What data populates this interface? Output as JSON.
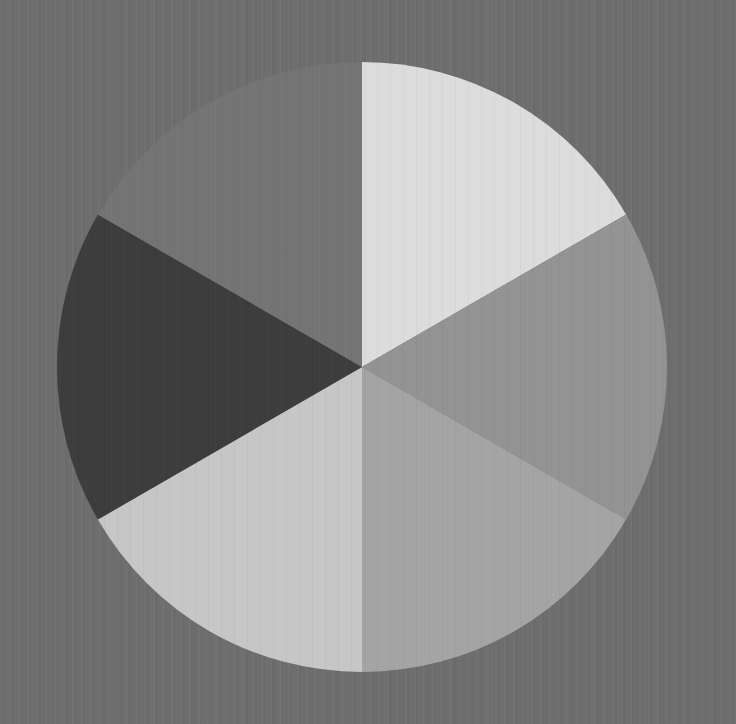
{
  "chart_data": {
    "type": "pie",
    "title": "",
    "start_angle_deg": 0,
    "direction": "clockwise",
    "center": [
      362,
      367
    ],
    "radius": 305,
    "background_color": "#6e6e6e",
    "categories": [
      "Slice 1",
      "Slice 2",
      "Slice 3",
      "Slice 4",
      "Slice 5",
      "Slice 6"
    ],
    "values": [
      1,
      1,
      1,
      1,
      1,
      1
    ],
    "percentages": [
      16.67,
      16.67,
      16.67,
      16.67,
      16.67,
      16.67
    ],
    "colors": [
      "#dcdcdc",
      "#939393",
      "#a4a4a4",
      "#c6c6c6",
      "#3d3d3d",
      "#747474"
    ],
    "legend": null,
    "labels_shown": false
  }
}
